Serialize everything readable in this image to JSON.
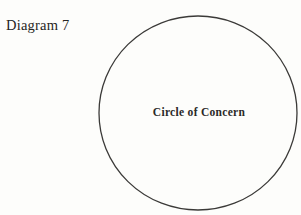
{
  "page": {
    "title": "Diagram 7",
    "diagram": {
      "circle_label": "Circle of Concern"
    },
    "colors": {
      "background": "#fdfdfb",
      "ink": "#262523",
      "circle_stroke": "#3b3a38"
    },
    "geometry": {
      "circle_center_x": "198",
      "circle_center_y": "113",
      "circle_radius_x": "99",
      "circle_radius_y": "97"
    }
  }
}
